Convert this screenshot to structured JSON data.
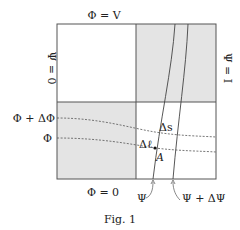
{
  "figure": {
    "caption": "Fig. 1",
    "labels": {
      "top": "Φ = V",
      "bottom": "Φ = 0",
      "left": "Ψ = 0",
      "right": "Ψ = I",
      "phi_plus_dphi": "Φ + ΔΦ",
      "phi": "Φ",
      "psi": "Ψ",
      "psi_plus_dpsi": "Ψ + ΔΨ",
      "delta_s": "Δs",
      "delta_l": "Δℓ",
      "point_a": "A"
    },
    "colors": {
      "shade": "#e4e4e4",
      "line": "#444444",
      "background": "#ffffff"
    }
  }
}
